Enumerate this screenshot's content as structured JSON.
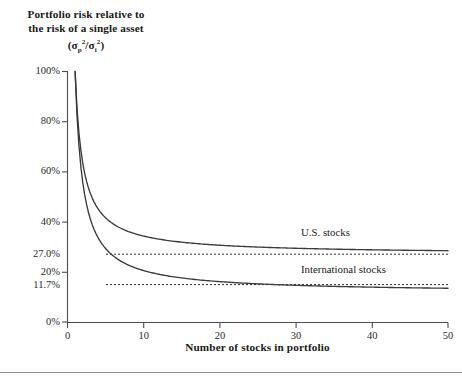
{
  "figure": {
    "y_axis_title_lines": [
      "Portfolio risk relative to",
      "the risk of a single asset"
    ],
    "y_axis_title_ratio_prefix": "(",
    "y_axis_title_ratio_suffix": ")",
    "x_axis_title": "Number of stocks in portfolio",
    "axis_color": "#4d4d4d",
    "curve_color": "#3a3a3a",
    "dotted_color": "#2b2b2b"
  },
  "chart_data": {
    "type": "line",
    "xlabel": "Number of stocks in portfolio",
    "ylabel": "Portfolio risk relative to the risk of a single asset (σp²/σi²)",
    "xlim": [
      0,
      50
    ],
    "ylim": [
      0,
      100
    ],
    "grid": false,
    "legend_position": "inline-right",
    "x_ticks": [
      "0",
      "10",
      "20",
      "30",
      "40",
      "50"
    ],
    "x_tick_values": [
      0,
      10,
      20,
      30,
      40,
      50
    ],
    "y_ticks": [
      "0%",
      "20%",
      "40%",
      "60%",
      "80%",
      "100%"
    ],
    "y_tick_values": [
      0,
      20,
      40,
      60,
      80,
      100
    ],
    "y_annotation_ticks": [
      "27.0%",
      "11.7%"
    ],
    "y_annotation_values": [
      27.0,
      11.7
    ],
    "x": [
      1,
      2,
      3,
      4,
      5,
      6,
      7,
      8,
      9,
      10,
      12,
      15,
      20,
      25,
      30,
      35,
      40,
      45,
      50
    ],
    "series": [
      {
        "name": "U.S. stocks",
        "asymptote": 27.0,
        "values": [
          100.0,
          63.5,
          51.3,
          45.3,
          41.6,
          39.2,
          37.4,
          36.1,
          35.1,
          34.3,
          33.1,
          31.9,
          30.7,
          29.9,
          29.4,
          29.0,
          28.8,
          28.6,
          28.4
        ]
      },
      {
        "name": "International stocks",
        "asymptote": 11.7,
        "values": [
          100.0,
          55.9,
          41.2,
          33.8,
          29.4,
          26.5,
          24.4,
          22.8,
          21.6,
          20.6,
          19.1,
          17.6,
          16.1,
          15.2,
          14.6,
          14.2,
          13.9,
          13.6,
          13.4
        ]
      }
    ],
    "annotations": [
      {
        "label": "27.0%",
        "value": 27.0,
        "style": "dotted-horizontal-line"
      },
      {
        "label": "11.7%",
        "value": 11.7,
        "style": "dotted-horizontal-line"
      }
    ]
  }
}
